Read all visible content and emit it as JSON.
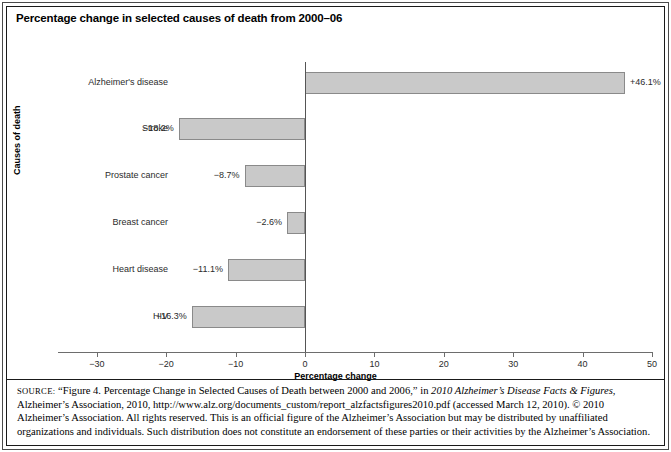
{
  "figure": {
    "title": "Percentage change in selected causes of death from 2000–06"
  },
  "chart_data": {
    "type": "bar",
    "orientation": "horizontal",
    "title": "Percentage change in selected causes of death from 2000–06",
    "xlabel": "Percentage change",
    "ylabel": "Causes of death",
    "xlim": [
      -30,
      50
    ],
    "xticks": [
      -30,
      -20,
      -10,
      0,
      10,
      20,
      30,
      40,
      50
    ],
    "xtick_labels": [
      "−30",
      "−20",
      "−10",
      "0",
      "10",
      "20",
      "30",
      "40",
      "50"
    ],
    "grid": false,
    "legend": null,
    "categories": [
      "Alzheimer's disease",
      "Stroke",
      "Prostate cancer",
      "Breast cancer",
      "Heart disease",
      "HIV"
    ],
    "values": [
      46.1,
      -18.2,
      -8.7,
      -2.6,
      -11.1,
      -16.3
    ],
    "data_labels": [
      "+46.1%",
      "−18.2%",
      "−8.7%",
      "−2.6%",
      "−11.1%",
      "−16.3%"
    ],
    "bar_fill_color": "#c9c9c9",
    "bar_border_color": "#8a8a8a"
  },
  "source": {
    "label": "SOURCE:",
    "line_1_a": " “Figure 4. Percentage Change in Selected Causes of Death between 2000 and 2006,” in ",
    "line_1_italic": "2010 Alzheimer’s Disease Facts & Figures",
    "line_1_b": ", Alzheimer’s Association, 2010, http://www.alz.org/documents_custom/report_alzfactsfigures2010.pdf (accessed March 12, 2010). © 2010 Alzheimer’s Association. All rights reserved. This is an official figure of the Alzheimer’s Association but may be distributed by unaffiliated organizations and individuals. Such distribution does not constitute an endorsement of these parties or their activities by the Alzheimer’s Association."
  }
}
